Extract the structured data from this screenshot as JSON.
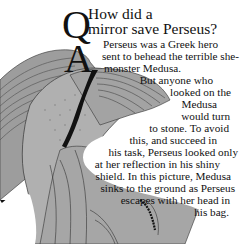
{
  "page": {
    "question_letter": "Q",
    "answer_letter": "A",
    "question_lines": [
      "How did a",
      "mirror save Perseus?"
    ],
    "answer_lines": [
      "Perseus was a Greek hero",
      "sent to behead the terrible she-",
      "monster Medusa.",
      "But anyone who",
      "looked on the",
      "Medusa",
      "would turn",
      "to stone. To avoid",
      "this, and succeed in",
      "his task, Perseus looked only",
      "at her reflection in his shiny",
      "shield. In this picture, Medusa",
      "sinks to the ground as Perseus",
      "escapes with her head in",
      "his bag."
    ],
    "illustration": {
      "subject": "Medusa with feathered wings sinking to the ground",
      "palette": {
        "fill": "#a8a8a8",
        "dark_fill": "#8e8e8e",
        "line": "#2a2a2a",
        "background": "#ffffff"
      }
    }
  }
}
